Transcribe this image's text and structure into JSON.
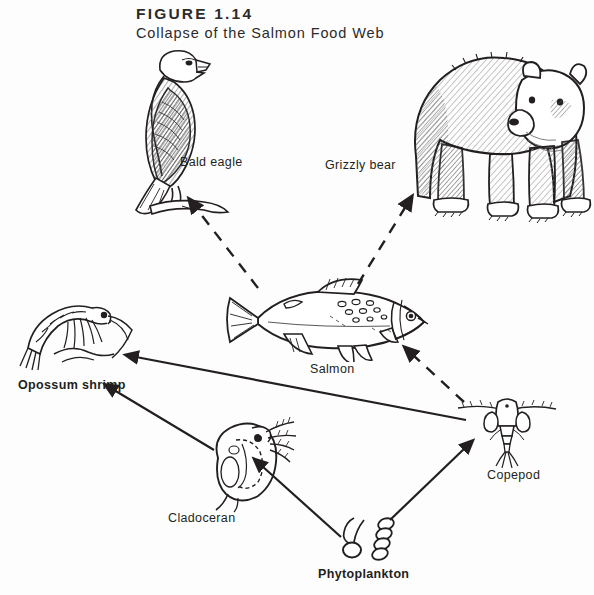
{
  "figure": {
    "number": "FIGURE 1.14",
    "title": "Collapse of the Salmon Food Web"
  },
  "colors": {
    "background": "#fdfdfd",
    "ink": "#231f20",
    "heading": "#2b2b2b",
    "shading": "#8a8a8a"
  },
  "nodes": [
    {
      "id": "bald-eagle",
      "label": "Bald eagle",
      "x": 180,
      "y": 155,
      "trophic": "top predator"
    },
    {
      "id": "grizzly-bear",
      "label": "Grizzly bear",
      "x": 325,
      "y": 158,
      "trophic": "top predator"
    },
    {
      "id": "salmon",
      "label": "Salmon",
      "x": 310,
      "y": 362,
      "trophic": "fish"
    },
    {
      "id": "opossum-shrimp",
      "label": "Opossum shrimp",
      "x": 18,
      "y": 378,
      "trophic": "invertebrate"
    },
    {
      "id": "copepod",
      "label": "Copepod",
      "x": 487,
      "y": 468,
      "trophic": "zooplankton"
    },
    {
      "id": "cladoceran",
      "label": "Cladoceran",
      "x": 168,
      "y": 511,
      "trophic": "zooplankton"
    },
    {
      "id": "phytoplankton",
      "label": "Phytoplankton",
      "x": 318,
      "y": 567,
      "trophic": "producer"
    }
  ],
  "links": [
    {
      "from": "salmon",
      "to": "bald-eagle",
      "style": "dashed"
    },
    {
      "from": "salmon",
      "to": "grizzly-bear",
      "style": "dashed"
    },
    {
      "from": "copepod",
      "to": "salmon",
      "style": "dashed"
    },
    {
      "from": "copepod",
      "to": "opossum-shrimp",
      "style": "solid"
    },
    {
      "from": "cladoceran",
      "to": "opossum-shrimp",
      "style": "solid"
    },
    {
      "from": "phytoplankton",
      "to": "cladoceran",
      "style": "solid"
    },
    {
      "from": "phytoplankton",
      "to": "copepod",
      "style": "solid"
    }
  ]
}
